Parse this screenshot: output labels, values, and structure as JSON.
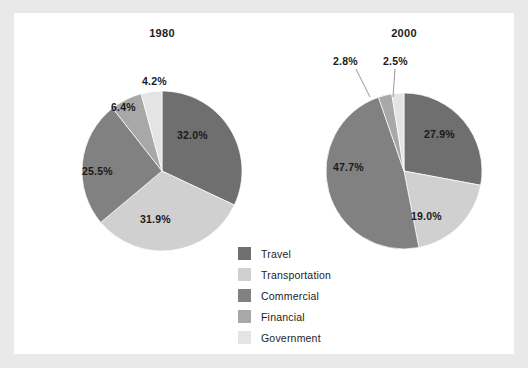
{
  "figure": {
    "background_color": "#e9e9e9",
    "panel_color": "#ffffff"
  },
  "legend": {
    "position": "center-bottom",
    "items": [
      {
        "label": "Travel",
        "color": "#6f6f6f"
      },
      {
        "label": "Transportation",
        "color": "#d0d0d0"
      },
      {
        "label": "Commercial",
        "color": "#818181"
      },
      {
        "label": "Financial",
        "color": "#a8a8a8"
      },
      {
        "label": "Government",
        "color": "#e4e4e4"
      }
    ]
  },
  "chart_data": [
    {
      "type": "pie",
      "title": "1980",
      "categories": [
        "Travel",
        "Transportation",
        "Commercial",
        "Financial",
        "Government"
      ],
      "values": [
        32.0,
        31.9,
        25.5,
        6.4,
        4.2
      ],
      "labels": [
        "32.0%",
        "31.9%",
        "25.5%",
        "6.4%",
        "4.2%"
      ],
      "colors": [
        "#6f6f6f",
        "#d0d0d0",
        "#818181",
        "#a8a8a8",
        "#e4e4e4"
      ],
      "start_angle_deg": 0,
      "direction": "clockwise",
      "center": [
        148,
        158
      ],
      "radius": 80,
      "label_positions": [
        {
          "text": "32.0%",
          "x": 163,
          "y": 116
        },
        {
          "text": "31.9%",
          "x": 126,
          "y": 200
        },
        {
          "text": "25.5%",
          "x": 68,
          "y": 152
        },
        {
          "text": "6.4%",
          "x": 97,
          "y": 88
        },
        {
          "text": "4.2%",
          "x": 128,
          "y": 62
        }
      ]
    },
    {
      "type": "pie",
      "title": "2000",
      "categories": [
        "Travel",
        "Transportation",
        "Commercial",
        "Financial",
        "Government"
      ],
      "values": [
        27.9,
        19.0,
        47.7,
        2.8,
        2.5
      ],
      "labels": [
        "27.9%",
        "19.0%",
        "47.7%",
        "2.8%",
        "2.5%"
      ],
      "colors": [
        "#6f6f6f",
        "#d0d0d0",
        "#818181",
        "#a8a8a8",
        "#e4e4e4"
      ],
      "start_angle_deg": 0,
      "direction": "clockwise",
      "center": [
        390,
        158
      ],
      "radius": 78,
      "label_positions": [
        {
          "text": "27.9%",
          "x": 410,
          "y": 115
        },
        {
          "text": "19.0%",
          "x": 397,
          "y": 197
        },
        {
          "text": "47.7%",
          "x": 319,
          "y": 148
        },
        {
          "text": "2.8%",
          "x": 319,
          "y": 42
        },
        {
          "text": "2.5%",
          "x": 369,
          "y": 42
        }
      ],
      "leader_lines": [
        {
          "from": [
            342,
            56
          ],
          "to": [
            356,
            84
          ]
        },
        {
          "from": [
            381,
            56
          ],
          "to": [
            379,
            84
          ]
        }
      ]
    }
  ]
}
